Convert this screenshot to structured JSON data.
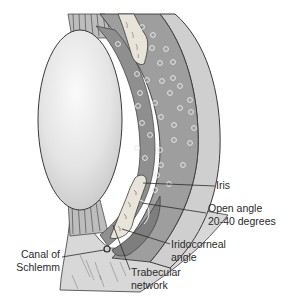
{
  "figure": {
    "colors": {
      "lens": "#e6e6e6",
      "iris_chamber": "#9a9a9a",
      "cornea": "#cfcfcf",
      "sclera_tissue": "#d6d6d6",
      "outline": "#3a3a3a",
      "bubble": "#e9e9e9"
    }
  },
  "labels": {
    "iris": "Iris",
    "open_angle": [
      "Open angle",
      "20-40 degrees"
    ],
    "iridocorneal_angle": [
      "Iridocorneal",
      "angle"
    ],
    "canal_of_schlemm": [
      "Canal of",
      "Schlemm"
    ],
    "trabecular_network": [
      "Trabecular",
      "network"
    ]
  }
}
